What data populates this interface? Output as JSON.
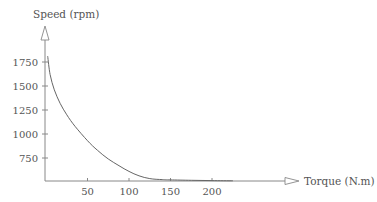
{
  "chart_data": {
    "type": "line",
    "title": "",
    "xlabel": "Torque (N.m)",
    "ylabel": "Speed (rpm)",
    "x_ticks": [
      50,
      100,
      150,
      200
    ],
    "y_ticks": [
      750,
      1000,
      1250,
      1500,
      1750
    ],
    "xlim": [
      0,
      230
    ],
    "ylim": [
      500,
      1850
    ],
    "grid": false,
    "legend": null,
    "series": [
      {
        "name": "Speed-torque characteristic",
        "x": [
          2,
          5,
          10,
          17,
          25,
          35,
          50,
          62,
          75,
          88,
          100,
          112,
          125,
          140,
          150,
          175,
          200,
          225
        ],
        "y": [
          1810,
          1620,
          1460,
          1320,
          1200,
          1080,
          930,
          830,
          740,
          670,
          610,
          565,
          535,
          525,
          522,
          518,
          515,
          512
        ]
      }
    ],
    "colors": {
      "axis": "#777777",
      "curve": "#666666",
      "text": "#555555"
    }
  }
}
